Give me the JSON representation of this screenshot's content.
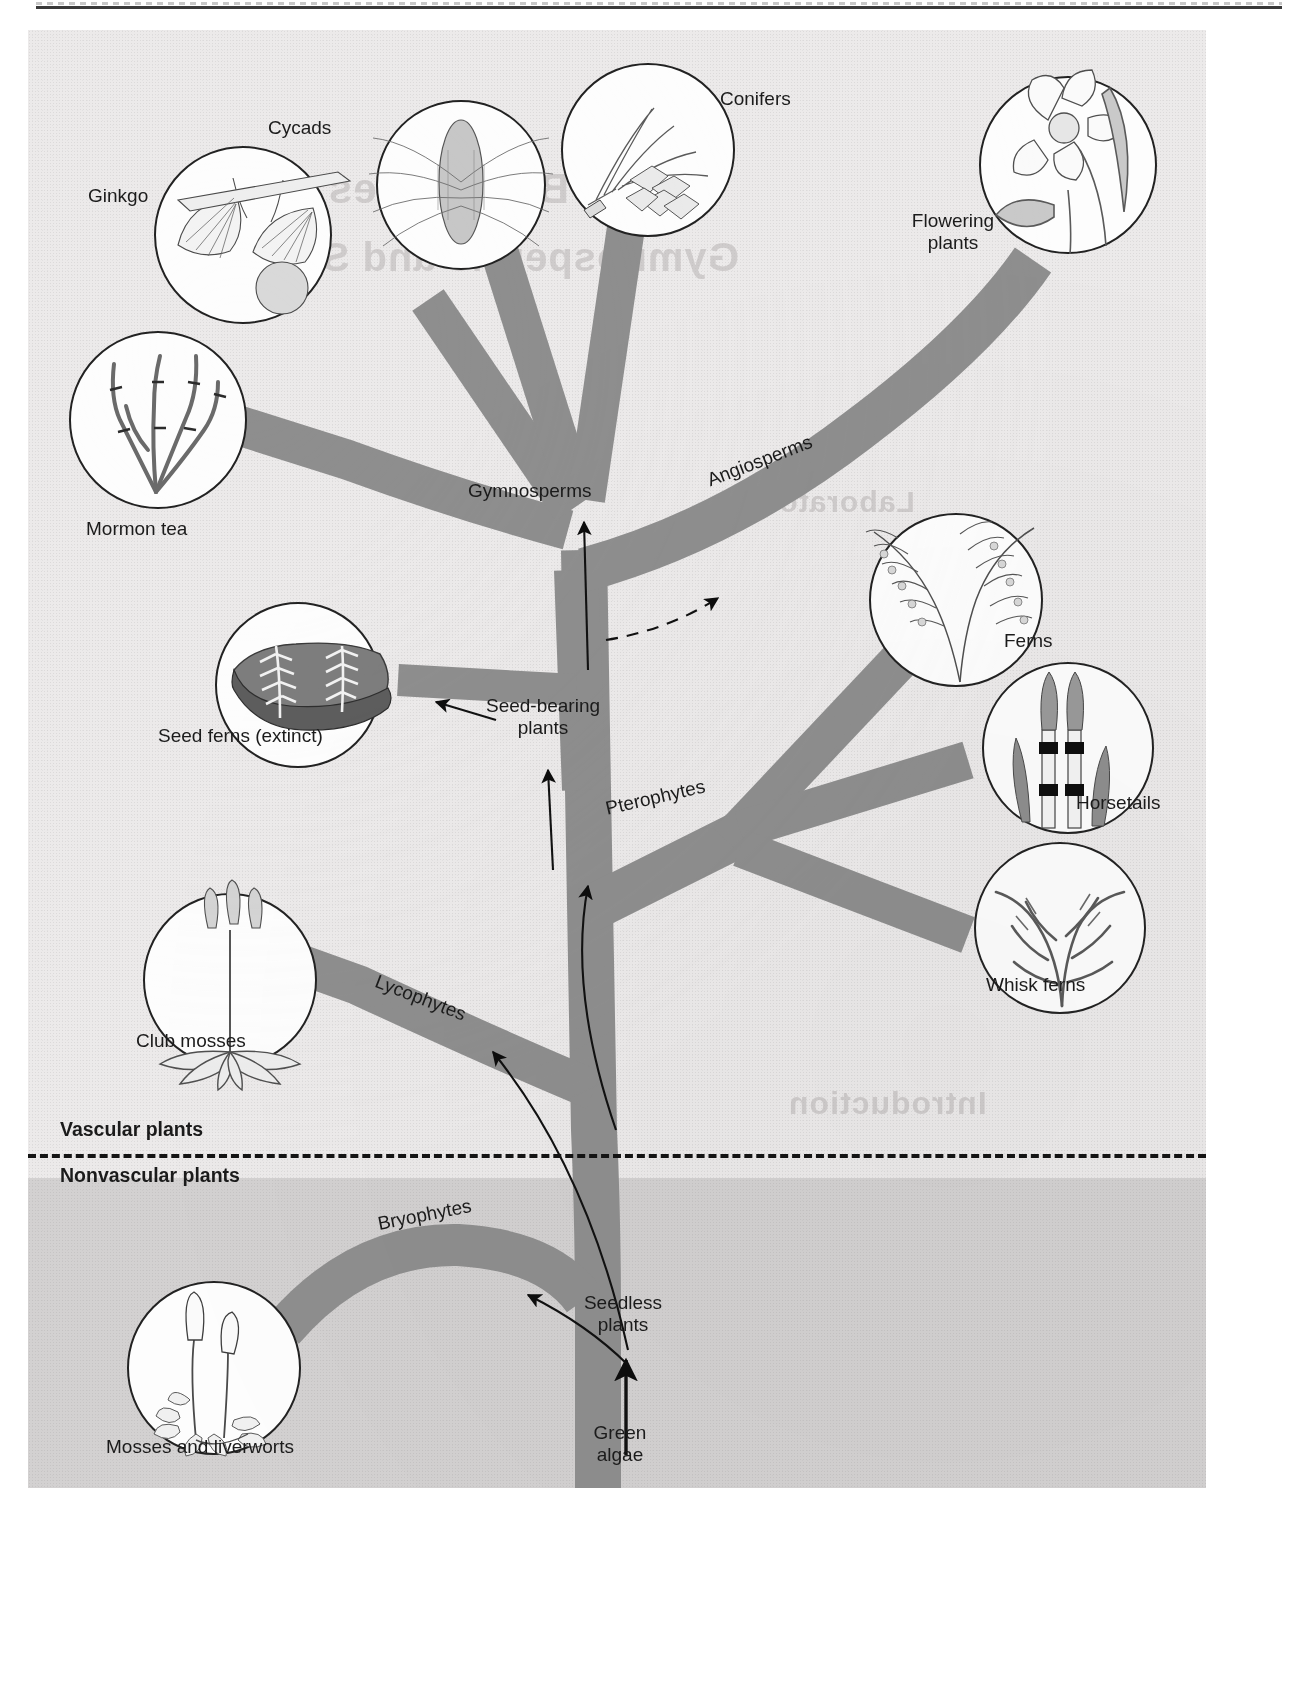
{
  "figure": {
    "background_color": "#eceaea",
    "branch_color": "#8e8e8e",
    "lower_band_color": "#d3d1d1",
    "line_color": "#141414"
  },
  "groups": {
    "vascular": "Vascular plants",
    "nonvascular": "Nonvascular plants"
  },
  "clade_labels": {
    "gymnosperms": "Gymnosperms",
    "angiosperms": "Angiosperms",
    "seed_bearing_line1": "Seed-bearing",
    "seed_bearing_line2": "plants",
    "pterophytes": "Pterophytes",
    "lycophytes": "Lycophytes",
    "bryophytes": "Bryophytes",
    "seedless_line1": "Seedless",
    "seedless_line2": "plants",
    "green_algae_line1": "Green",
    "green_algae_line2": "algae"
  },
  "taxa": [
    {
      "id": "ginkgo",
      "label": "Ginkgo"
    },
    {
      "id": "cycads",
      "label": "Cycads"
    },
    {
      "id": "conifers",
      "label": "Conifers"
    },
    {
      "id": "flowering",
      "label_line1": "Flowering",
      "label_line2": "plants"
    },
    {
      "id": "mormon-tea",
      "label": "Mormon tea"
    },
    {
      "id": "seed-ferns",
      "label": "Seed ferns (extinct)"
    },
    {
      "id": "ferns",
      "label": "Ferns"
    },
    {
      "id": "horsetails",
      "label": "Horsetails"
    },
    {
      "id": "whisk-ferns",
      "label": "Whisk ferns"
    },
    {
      "id": "club-mosses",
      "label": "Club mosses"
    },
    {
      "id": "mosses",
      "label": "Mosses and liverworts"
    }
  ],
  "ghost_text": {
    "t1": "Bryophytes",
    "t2": "Gymnosperms and Seedless",
    "t3": "Laboratory",
    "t4": "Introduction"
  }
}
